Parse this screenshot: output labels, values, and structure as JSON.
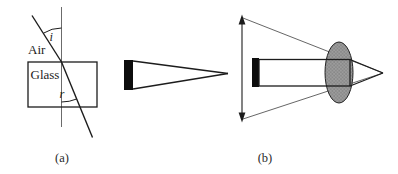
{
  "colors": {
    "background": "#ffffff",
    "line": "#1c1c1c",
    "normal_line": "#5a5a5a",
    "thin_ray": "#4a4a4a",
    "bar_fill": "#0d0d0d",
    "lens_fill": "#9c9c9c",
    "lens_dot": "#6e6e6e",
    "lens_stroke": "#222222"
  },
  "panel_a": {
    "caption": "(a)",
    "labels": {
      "air": "Air",
      "glass": "Glass",
      "incidence_angle": "i",
      "refraction_angle": "r"
    }
  },
  "panel_b": {
    "caption": "(b)"
  }
}
